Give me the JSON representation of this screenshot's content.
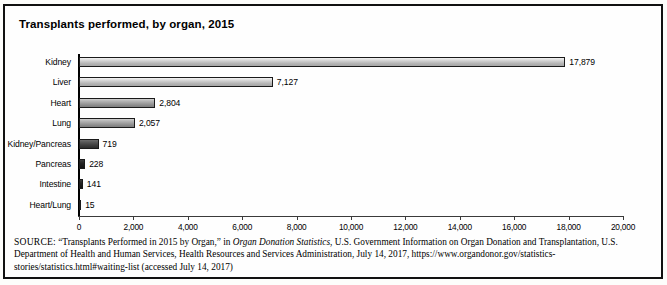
{
  "figure": {
    "title": "Transplants performed, by organ, 2015"
  },
  "chart_data": {
    "type": "bar",
    "orientation": "horizontal",
    "title": "Transplants performed, by organ, 2015",
    "xlabel": "",
    "ylabel": "",
    "xlim": [
      0,
      20000
    ],
    "grid": false,
    "legend": "none",
    "categories": [
      "Kidney",
      "Liver",
      "Heart",
      "Lung",
      "Kidney/Pancreas",
      "Pancreas",
      "Intestine",
      "Heart/Lung"
    ],
    "values": [
      17879,
      7127,
      2804,
      2057,
      719,
      228,
      141,
      15
    ],
    "value_labels": [
      "17,879",
      "7,127",
      "2,804",
      "2,057",
      "719",
      "228",
      "141",
      "15"
    ],
    "bar_shades": [
      "light",
      "light",
      "mid",
      "mid",
      "dark",
      "darkest",
      "darkest",
      "darkest"
    ],
    "xticks": [
      0,
      2000,
      4000,
      6000,
      8000,
      10000,
      12000,
      14000,
      16000,
      18000,
      20000
    ],
    "xtick_labels": [
      "0",
      "2,000",
      "4,000",
      "6,000",
      "8,000",
      "10,000",
      "12,000",
      "14,000",
      "16,000",
      "18,000",
      "20,000"
    ]
  },
  "source": {
    "label": "SOURCE:",
    "part1": " “Transplants Performed in 2015 by Organ,” in ",
    "italic1": "Organ Donation Statistics",
    "part2": ", U.S. Government Information on Organ Donation and Transplantation, U.S. Department of Health and Human Services, Health Resources and Services Administration, July 14, 2017, https://www.organdonor.gov/statistics-stories/statistics.html#waiting-list (accessed July 14, 2017)"
  }
}
